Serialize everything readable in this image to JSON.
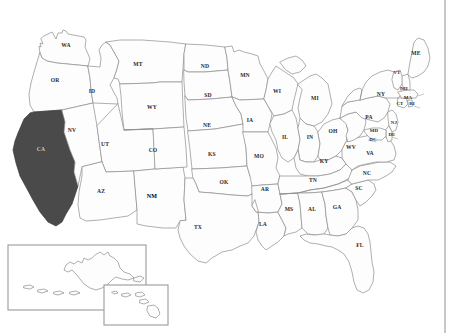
{
  "figure": {
    "title": "",
    "background_color": "#ffffff",
    "border_color": "#9a9a9a"
  },
  "chart_data": {
    "type": "map",
    "title": "",
    "projection": "United States choropleth outline map",
    "highlight_color": "#4a4a4a",
    "default_fill": "#fdfdfd",
    "outline_color": "#8c8c8c",
    "highlighted_states": [
      "CA"
    ],
    "emphasized_labels": [
      "NM"
    ],
    "insets": [
      {
        "id": "alaska",
        "label": "AK"
      },
      {
        "id": "hawaii",
        "label": "HI"
      }
    ],
    "labels": [
      {
        "code": "WA",
        "x": 66,
        "y": 46,
        "fill": false
      },
      {
        "code": "OR",
        "x": 55,
        "y": 81,
        "fill": false
      },
      {
        "code": "CA",
        "x": 41,
        "y": 150,
        "fill": true
      },
      {
        "code": "NV",
        "x": 72,
        "y": 131,
        "fill": false
      },
      {
        "code": "ID",
        "x": 92,
        "y": 92,
        "fill": false
      },
      {
        "code": "MT",
        "x": 138,
        "y": 65,
        "fill": false
      },
      {
        "code": "WY",
        "x": 152,
        "y": 108,
        "fill": false
      },
      {
        "code": "UT",
        "x": 105,
        "y": 145,
        "fill": false
      },
      {
        "code": "AZ",
        "x": 101,
        "y": 192,
        "fill": false
      },
      {
        "code": "NM",
        "x": 152,
        "y": 197,
        "fill": false,
        "emph": true
      },
      {
        "code": "CO",
        "x": 153,
        "y": 151,
        "fill": false
      },
      {
        "code": "ND",
        "x": 205,
        "y": 67,
        "fill": false
      },
      {
        "code": "SD",
        "x": 208,
        "y": 96,
        "fill": false
      },
      {
        "code": "NE",
        "x": 207,
        "y": 126,
        "fill": false
      },
      {
        "code": "KS",
        "x": 212,
        "y": 155,
        "fill": false
      },
      {
        "code": "OK",
        "x": 224,
        "y": 183,
        "fill": false
      },
      {
        "code": "TX",
        "x": 198,
        "y": 228,
        "fill": false
      },
      {
        "code": "MN",
        "x": 245,
        "y": 76,
        "fill": false
      },
      {
        "code": "IA",
        "x": 250,
        "y": 121,
        "fill": false
      },
      {
        "code": "MO",
        "x": 259,
        "y": 157,
        "fill": false
      },
      {
        "code": "AR",
        "x": 265,
        "y": 190,
        "fill": false
      },
      {
        "code": "LA",
        "x": 263,
        "y": 225,
        "fill": false
      },
      {
        "code": "WI",
        "x": 277,
        "y": 92,
        "fill": false
      },
      {
        "code": "IL",
        "x": 285,
        "y": 138,
        "fill": false
      },
      {
        "code": "MS",
        "x": 289,
        "y": 210,
        "fill": false
      },
      {
        "code": "MI",
        "x": 315,
        "y": 99,
        "fill": false
      },
      {
        "code": "IN",
        "x": 310,
        "y": 138,
        "fill": false
      },
      {
        "code": "OH",
        "x": 333,
        "y": 132,
        "fill": false
      },
      {
        "code": "KY",
        "x": 324,
        "y": 162,
        "fill": false
      },
      {
        "code": "TN",
        "x": 313,
        "y": 181,
        "fill": false
      },
      {
        "code": "AL",
        "x": 312,
        "y": 210,
        "fill": false
      },
      {
        "code": "GA",
        "x": 337,
        "y": 208,
        "fill": false
      },
      {
        "code": "FL",
        "x": 360,
        "y": 246,
        "fill": false
      },
      {
        "code": "SC",
        "x": 359,
        "y": 189,
        "fill": false
      },
      {
        "code": "NC",
        "x": 367,
        "y": 174,
        "fill": false
      },
      {
        "code": "VA",
        "x": 370,
        "y": 154,
        "fill": false
      },
      {
        "code": "WV",
        "x": 351,
        "y": 148,
        "fill": false
      },
      {
        "code": "PA",
        "x": 369,
        "y": 118,
        "fill": false
      },
      {
        "code": "NY",
        "x": 381,
        "y": 95,
        "fill": false
      },
      {
        "code": "MD",
        "x": 374,
        "y": 131,
        "fill": false,
        "tiny": true
      },
      {
        "code": "DC",
        "x": 373,
        "y": 140,
        "fill": false,
        "tiny": true
      },
      {
        "code": "DE",
        "x": 392,
        "y": 135,
        "fill": false,
        "tiny": true
      },
      {
        "code": "NJ",
        "x": 394,
        "y": 123,
        "fill": false,
        "tiny": true
      },
      {
        "code": "CT",
        "x": 400,
        "y": 104,
        "fill": false,
        "tiny": true
      },
      {
        "code": "RI",
        "x": 412,
        "y": 104,
        "fill": false,
        "tiny": true
      },
      {
        "code": "MA",
        "x": 408,
        "y": 98,
        "fill": false,
        "tiny": true
      },
      {
        "code": "NH",
        "x": 404,
        "y": 89,
        "fill": false,
        "tiny": true
      },
      {
        "code": "VT",
        "x": 397,
        "y": 73,
        "fill": false,
        "tiny": true
      },
      {
        "code": "ME",
        "x": 416,
        "y": 54,
        "fill": false
      }
    ]
  }
}
